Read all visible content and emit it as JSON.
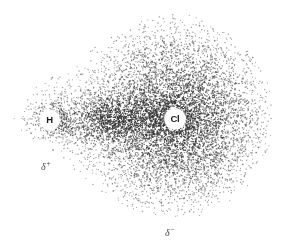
{
  "figure": {
    "background_color": "#ffffff",
    "stipple_color": "#303030",
    "width": 286,
    "height": 250
  },
  "atoms": [
    {
      "symbol": "H",
      "name": "hydrogen",
      "x": 50,
      "y": 120,
      "label_radius": 8.5
    },
    {
      "symbol": "Cl",
      "name": "chlorine",
      "x": 175,
      "y": 119,
      "label_radius": 9
    }
  ],
  "charges": [
    {
      "id": "partial-positive",
      "glyph": "δ",
      "sign": "+",
      "x": 48,
      "y": 166,
      "near_atom": "H"
    },
    {
      "id": "partial-negative",
      "glyph": "δ",
      "sign": "−",
      "x": 172,
      "y": 232,
      "near_atom": "Cl"
    }
  ],
  "chart_data": {
    "type": "scatter",
    "xlabel": "",
    "ylabel": "",
    "xlim": [
      0,
      286
    ],
    "ylim": [
      0,
      250
    ],
    "grid": false,
    "legend": null,
    "annotations": [
      "H",
      "Cl",
      "δ+",
      "δ−"
    ],
    "density_centers": [
      {
        "name": "chlorine-core",
        "x": 178,
        "y": 118,
        "radius": 62,
        "peak_density": 1.0
      },
      {
        "name": "bond-axis",
        "x": 112,
        "y": 119,
        "radius": 26,
        "peak_density": 0.78
      },
      {
        "name": "hydrogen-core",
        "x": 52,
        "y": 120,
        "radius": 20,
        "peak_density": 0.55
      }
    ],
    "outline_points": [
      [
        12,
        121
      ],
      [
        20,
        104
      ],
      [
        34,
        88
      ],
      [
        54,
        74
      ],
      [
        78,
        58
      ],
      [
        104,
        40
      ],
      [
        130,
        25
      ],
      [
        156,
        16
      ],
      [
        182,
        14
      ],
      [
        208,
        20
      ],
      [
        232,
        34
      ],
      [
        252,
        54
      ],
      [
        266,
        80
      ],
      [
        272,
        108
      ],
      [
        271,
        136
      ],
      [
        263,
        163
      ],
      [
        248,
        186
      ],
      [
        228,
        203
      ],
      [
        204,
        214
      ],
      [
        178,
        218
      ],
      [
        152,
        216
      ],
      [
        128,
        208
      ],
      [
        106,
        195
      ],
      [
        84,
        178
      ],
      [
        62,
        158
      ],
      [
        42,
        143
      ],
      [
        24,
        133
      ],
      [
        12,
        121
      ]
    ],
    "stipple_point_count": 9000
  }
}
